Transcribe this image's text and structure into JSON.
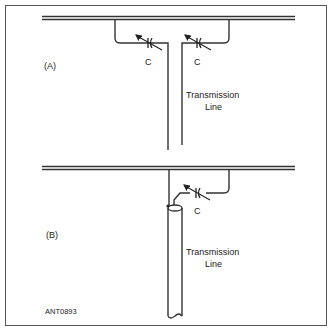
{
  "panels": {
    "a": {
      "label": "(A)",
      "capacitor_left_label": "C",
      "capacitor_right_label": "C",
      "line_label_1": "Transmission",
      "line_label_2": "Line"
    },
    "b": {
      "label": "(B)",
      "capacitor_label": "C",
      "line_label_1": "Transmission",
      "line_label_2": "Line"
    }
  },
  "figure_id": "ANT0893"
}
